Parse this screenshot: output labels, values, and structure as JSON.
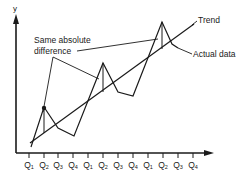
{
  "chart_data": {
    "type": "line",
    "title": "",
    "xlabel": "",
    "ylabel": "y",
    "categories": [
      "Q1",
      "Q2",
      "Q3",
      "Q4",
      "Q1",
      "Q2",
      "Q3",
      "Q4",
      "Q1",
      "Q2",
      "Q3",
      "Q4"
    ],
    "series": [
      {
        "name": "Actual data",
        "values": [
          10,
          42,
          24,
          17,
          38,
          76,
          52,
          48,
          55,
          91,
          73,
          70
        ]
      },
      {
        "name": "Trend",
        "values": [
          14,
          22,
          30,
          38,
          46,
          53,
          61,
          69,
          77,
          84,
          92,
          100
        ]
      }
    ],
    "annotations": [
      {
        "text": "Same absolute difference",
        "points_to": [
          "Q2 (year 1)",
          "Q2 (year 2)",
          "Q2 (year 3)"
        ]
      },
      {
        "text": "Trend",
        "points_to": "trend line"
      },
      {
        "text": "Actual data",
        "points_to": "actual data line"
      }
    ],
    "grid": false,
    "legend": "none (inline labels)"
  },
  "labels": {
    "y_axis": "y",
    "same_diff_line1": "Same absolute",
    "same_diff_line2": "difference",
    "trend": "Trend",
    "actual": "Actual data"
  },
  "ticks": [
    {
      "q": "Q",
      "n": "1"
    },
    {
      "q": "Q",
      "n": "2"
    },
    {
      "q": "Q",
      "n": "3"
    },
    {
      "q": "Q",
      "n": "4"
    },
    {
      "q": "Q",
      "n": "1"
    },
    {
      "q": "Q",
      "n": "2"
    },
    {
      "q": "Q",
      "n": "3"
    },
    {
      "q": "Q",
      "n": "4"
    },
    {
      "q": "Q",
      "n": "1"
    },
    {
      "q": "Q",
      "n": "2"
    },
    {
      "q": "Q",
      "n": "3"
    },
    {
      "q": "Q",
      "n": "4"
    }
  ],
  "colors": {
    "line": "#1a1a1a",
    "background": "#ffffff"
  }
}
